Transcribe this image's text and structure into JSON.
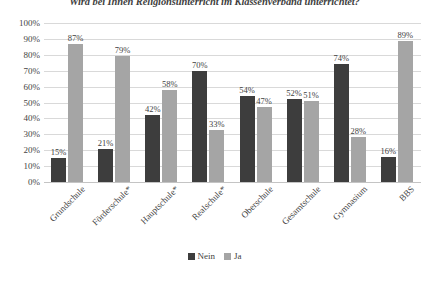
{
  "chart_data": {
    "type": "bar",
    "title": "Wird bei Ihnen Religionsunterricht im Klassenverband unterrichtet?",
    "xlabel": "",
    "ylabel": "",
    "ylim": [
      0,
      100
    ],
    "grid": true,
    "legend_position": "bottom",
    "categories": [
      "Grundschule",
      "Förderschule*",
      "Hauptschule*",
      "Realschule*",
      "Oberschule",
      "Gesamtschule",
      "Gymnasium",
      "BBS"
    ],
    "series": [
      {
        "name": "Nein",
        "color": "#3d3d3d",
        "values": [
          15,
          21,
          42,
          70,
          54,
          52,
          74,
          16
        ],
        "labels": [
          "15%",
          "21%",
          "42%",
          "70%",
          "54%",
          "52%",
          "74%",
          "16%"
        ]
      },
      {
        "name": "Ja",
        "color": "#a5a5a5",
        "values": [
          87,
          79,
          58,
          33,
          47,
          51,
          28,
          89
        ],
        "labels": [
          "87%",
          "79%",
          "58%",
          "33%",
          "47%",
          "51%",
          "28%",
          "89%"
        ]
      }
    ],
    "y_ticks": [
      {
        "value": 100,
        "label": "100%"
      },
      {
        "value": 90,
        "label": "90%"
      },
      {
        "value": 80,
        "label": "80%"
      },
      {
        "value": 70,
        "label": "70%"
      },
      {
        "value": 60,
        "label": "60%"
      },
      {
        "value": 50,
        "label": "50%"
      },
      {
        "value": 40,
        "label": "40%"
      },
      {
        "value": 30,
        "label": "30%"
      },
      {
        "value": 20,
        "label": "20%"
      },
      {
        "value": 10,
        "label": "10%"
      },
      {
        "value": 0,
        "label": "0%"
      }
    ],
    "legend": [
      {
        "label": "Nein",
        "color": "#3d3d3d"
      },
      {
        "label": "Ja",
        "color": "#a5a5a5"
      }
    ]
  }
}
